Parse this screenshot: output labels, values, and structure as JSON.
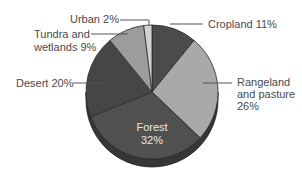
{
  "chart_data": {
    "type": "pie",
    "style": "3d-pie-grayscale",
    "title": "",
    "start_angle_deg": 0,
    "direction": "clockwise",
    "categories": [
      "Cropland",
      "Rangeland and pasture",
      "Forest",
      "Desert",
      "Tundra and wetlands",
      "Urban"
    ],
    "values": [
      11,
      26,
      32,
      20,
      9,
      2
    ],
    "unit": "%",
    "colors": [
      "#4b4b4b",
      "#a9a9a9",
      "#505050",
      "#464646",
      "#9c9c9c",
      "#d2d2d2"
    ],
    "side_color": "#363636",
    "legend": "none (leader-line labels)"
  },
  "labels": {
    "cropland": "Cropland 11%",
    "rangeland_line1": "Rangeland",
    "rangeland_line2": "and pasture",
    "rangeland_line3": "26%",
    "forest_line1": "Forest",
    "forest_line2": "32%",
    "desert": "Desert 20%",
    "tundra_line1": "Tundra and",
    "tundra_line2": "wetlands 9%",
    "urban": "Urban 2%"
  }
}
